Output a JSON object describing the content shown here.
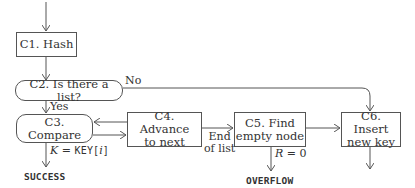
{
  "nodes": {
    "c1": {
      "label": "C1. Hash"
    },
    "c2": {
      "label": "C2. Is there a list?"
    },
    "c3": {
      "label": "C3. Compare"
    },
    "c4": {
      "line1": "C4. Advance",
      "line2": "to next"
    },
    "c5": {
      "line1": "C5. Find",
      "line2": "empty node"
    },
    "c6": {
      "line1": "C6. Insert",
      "line2": "new key"
    }
  },
  "edge_labels": {
    "no": "No",
    "yes": "Yes",
    "end_line1": "End",
    "end_line2": "of list",
    "k_var": "K",
    "k_eq": " = ",
    "k_key": "KEY[",
    "k_i": "i",
    "k_close": "]",
    "r_cond": "R",
    "r_eq": " = 0"
  },
  "terminals": {
    "success": "SUCCESS",
    "overflow": "OVERFLOW"
  },
  "colors": {
    "line": "#555555",
    "text": "#333333",
    "background": "#ffffff"
  }
}
